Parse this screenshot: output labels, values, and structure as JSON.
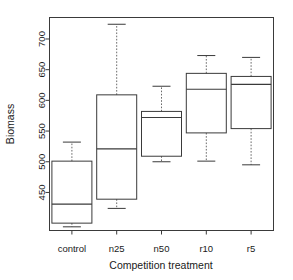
{
  "chart_data": {
    "type": "box",
    "title": "",
    "xlabel": "Competition treatment",
    "ylabel": "Biomass",
    "categories": [
      "control",
      "n25",
      "n50",
      "r10",
      "r5"
    ],
    "ytick_labels": [
      "450",
      "500",
      "550",
      "600",
      "650",
      "700"
    ],
    "ytick_values": [
      450,
      500,
      550,
      600,
      650,
      700
    ],
    "ylim": [
      388,
      735
    ],
    "grid": false,
    "legend": "none",
    "boxes": [
      {
        "category": "control",
        "whisker_low": 394,
        "q1": 400,
        "median": 431,
        "q3": 501,
        "whisker_high": 532
      },
      {
        "category": "n25",
        "whisker_low": 424,
        "q1": 439,
        "median": 521,
        "q3": 609,
        "whisker_high": 724
      },
      {
        "category": "n50",
        "whisker_low": 500,
        "q1": 509,
        "median": 572,
        "q3": 582,
        "whisker_high": 623
      },
      {
        "category": "r10",
        "whisker_low": 501,
        "q1": 547,
        "median": 618,
        "q3": 644,
        "whisker_high": 673
      },
      {
        "category": "r5",
        "whisker_low": 495,
        "q1": 554,
        "median": 626,
        "q3": 639,
        "whisker_high": 670
      }
    ],
    "colors": {
      "box_stroke": "#3a3a3a",
      "whisker_stroke": "#6a6a6a",
      "background": "#ffffff",
      "text": "#1a1a1a"
    }
  }
}
